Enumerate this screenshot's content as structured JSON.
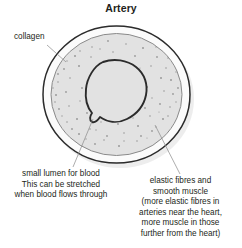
{
  "diagram": {
    "title": "Artery",
    "type": "cross-section",
    "background_color": "#ffffff",
    "text_color": "#231f20",
    "structure": {
      "outer_wall": {
        "name": "collagen",
        "fill_color": "#fbfbfb",
        "stroke_color": "#2b2b2b"
      },
      "middle_layer": {
        "name": "elastic fibres and smooth muscle",
        "fill_color": "#e2e2e2",
        "stroke_color": "#8a8a8a",
        "speckle_color": "#9a9a9a"
      },
      "lumen": {
        "name": "small lumen for blood",
        "fill_color": "#e2e2e2",
        "stroke_color": "#2b2b2b"
      }
    },
    "labels": {
      "collagen": "collagen",
      "lumen": "small lumen for blood\nThis can be stretched\nwhen blood flows through",
      "muscle": "elastic fibres and\nsmooth muscle\n(more elastic fibres in\narteries near the heart,\nmore muscle in those\nfurther from the heart)"
    }
  }
}
